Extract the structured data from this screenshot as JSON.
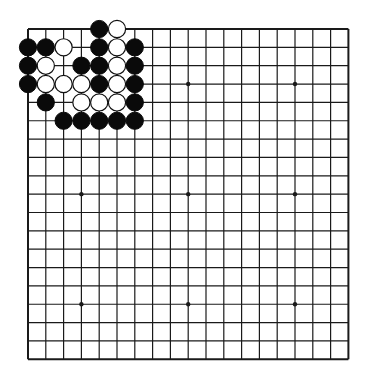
{
  "board": {
    "size": 19,
    "origin_x": 28,
    "origin_y": 29,
    "spacing_x": 17.8,
    "spacing_y": 18.35,
    "line_color": "#1a1a1a",
    "background": "#ffffff",
    "stone_radius": 8.6,
    "star_points": [
      [
        3,
        3
      ],
      [
        9,
        3
      ],
      [
        15,
        3
      ],
      [
        3,
        9
      ],
      [
        9,
        9
      ],
      [
        15,
        9
      ],
      [
        3,
        15
      ],
      [
        9,
        15
      ],
      [
        15,
        15
      ]
    ],
    "colors": {
      "black": "#0a0a0a",
      "white": "#ffffff",
      "white_outline": "#111111"
    }
  },
  "stones": [
    {
      "color": "black",
      "col": 4,
      "row": 0
    },
    {
      "color": "white",
      "col": 5,
      "row": 0
    },
    {
      "color": "black",
      "col": 0,
      "row": 1
    },
    {
      "color": "black",
      "col": 1,
      "row": 1
    },
    {
      "color": "white",
      "col": 2,
      "row": 1
    },
    {
      "color": "black",
      "col": 4,
      "row": 1
    },
    {
      "color": "white",
      "col": 5,
      "row": 1
    },
    {
      "color": "black",
      "col": 6,
      "row": 1
    },
    {
      "color": "black",
      "col": 0,
      "row": 2
    },
    {
      "color": "white",
      "col": 1,
      "row": 2
    },
    {
      "color": "black",
      "col": 3,
      "row": 2
    },
    {
      "color": "black",
      "col": 4,
      "row": 2
    },
    {
      "color": "white",
      "col": 5,
      "row": 2
    },
    {
      "color": "black",
      "col": 6,
      "row": 2
    },
    {
      "color": "black",
      "col": 0,
      "row": 3
    },
    {
      "color": "white",
      "col": 1,
      "row": 3
    },
    {
      "color": "white",
      "col": 2,
      "row": 3
    },
    {
      "color": "white",
      "col": 3,
      "row": 3
    },
    {
      "color": "black",
      "col": 4,
      "row": 3
    },
    {
      "color": "white",
      "col": 5,
      "row": 3
    },
    {
      "color": "black",
      "col": 6,
      "row": 3
    },
    {
      "color": "black",
      "col": 1,
      "row": 4
    },
    {
      "color": "white",
      "col": 3,
      "row": 4
    },
    {
      "color": "white",
      "col": 4,
      "row": 4
    },
    {
      "color": "white",
      "col": 5,
      "row": 4
    },
    {
      "color": "black",
      "col": 6,
      "row": 4
    },
    {
      "color": "black",
      "col": 2,
      "row": 5
    },
    {
      "color": "black",
      "col": 3,
      "row": 5
    },
    {
      "color": "black",
      "col": 4,
      "row": 5
    },
    {
      "color": "black",
      "col": 5,
      "row": 5
    },
    {
      "color": "black",
      "col": 6,
      "row": 5
    }
  ]
}
